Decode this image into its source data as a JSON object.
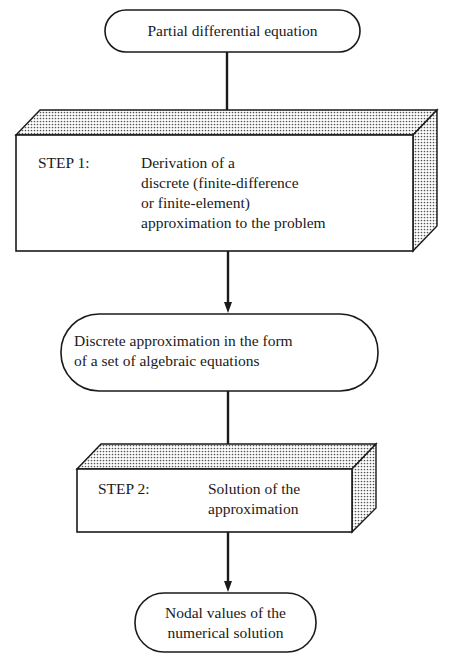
{
  "diagram": {
    "type": "flowchart",
    "nodes": {
      "start": {
        "shape": "terminal",
        "lines": [
          "Partial differential equation"
        ]
      },
      "step1": {
        "shape": "3d-box",
        "label": "STEP 1:",
        "lines": [
          "Derivation of a",
          "discrete (finite-difference",
          "or finite-element)",
          "approximation to the problem"
        ]
      },
      "intermediate": {
        "shape": "terminal",
        "lines": [
          "Discrete approximation in the form",
          "of a set of algebraic equations"
        ]
      },
      "step2": {
        "shape": "3d-box",
        "label": "STEP 2:",
        "lines": [
          "Solution of the",
          "approximation"
        ]
      },
      "end": {
        "shape": "terminal",
        "lines": [
          "Nodal values of the",
          "numerical solution"
        ]
      }
    },
    "edges": [
      {
        "from": "start",
        "to": "step1"
      },
      {
        "from": "step1",
        "to": "intermediate"
      },
      {
        "from": "intermediate",
        "to": "step2"
      },
      {
        "from": "step2",
        "to": "end"
      }
    ],
    "colors": {
      "stroke": "#1a1a1a",
      "fill": "#ffffff",
      "stipple": "#6e6e6e"
    }
  }
}
